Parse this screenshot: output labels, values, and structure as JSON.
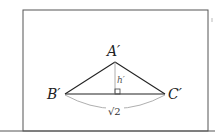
{
  "diagram": {
    "title": "",
    "vertices": {
      "apex": {
        "label": "A′",
        "x": 115,
        "y": 62
      },
      "left": {
        "label": "B′",
        "x": 65,
        "y": 94
      },
      "right": {
        "label": "C′",
        "x": 165,
        "y": 94
      },
      "foot": {
        "x": 115,
        "y": 94
      }
    },
    "height_label": "h′",
    "base_length_label": "√2",
    "right_angle_marker": true,
    "colors": {
      "stroke": "#222222",
      "light_stroke": "#9a9a9a",
      "frame": "#555555"
    }
  }
}
